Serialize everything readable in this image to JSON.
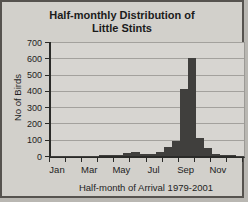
{
  "figure": {
    "title_line1": "Half-monthly Distribution of",
    "title_line2": "Little Stints",
    "x_axis_title": "Half-month of Arrival 1979-2001",
    "y_axis_title": "No of Birds"
  },
  "chart_data": {
    "type": "bar",
    "title": "Half-monthly Distribution of Little Stints",
    "xlabel": "Half-month of Arrival 1979-2001",
    "ylabel": "No of Birds",
    "ylim": [
      0,
      700
    ],
    "yticks": [
      0,
      100,
      200,
      300,
      400,
      500,
      600,
      700
    ],
    "grid": true,
    "legend_position": "none",
    "categories": [
      "Jan-1st half",
      "Jan-2nd half",
      "Feb-1st half",
      "Feb-2nd half",
      "Mar-1st half",
      "Mar-2nd half",
      "Apr-1st half",
      "Apr-2nd half",
      "May-1st half",
      "May-2nd half",
      "Jun-1st half",
      "Jun-2nd half",
      "Jul-1st half",
      "Jul-2nd half",
      "Aug-1st half",
      "Aug-2nd half",
      "Sep-1st half",
      "Sep-2nd half",
      "Oct-1st half",
      "Oct-2nd half",
      "Nov-1st half",
      "Nov-2nd half",
      "Dec-1st half",
      "Dec-2nd half"
    ],
    "values": [
      2,
      1,
      1,
      1,
      3,
      2,
      4,
      6,
      8,
      20,
      25,
      12,
      10,
      25,
      55,
      90,
      410,
      600,
      110,
      50,
      15,
      8,
      4,
      2
    ],
    "x_tick_labels": [
      "Jan",
      "Mar",
      "May",
      "Jul",
      "Sep",
      "Nov"
    ],
    "x_tick_months": [
      1,
      3,
      5,
      7,
      9,
      11
    ],
    "colors": {
      "bar": "#403f3d",
      "plot_background": "#d7d5d1",
      "figure_background": "#d2d0cb",
      "gridline": "#a3a19d",
      "frame_border": "#56534f",
      "text": "#1b1b1b"
    }
  }
}
